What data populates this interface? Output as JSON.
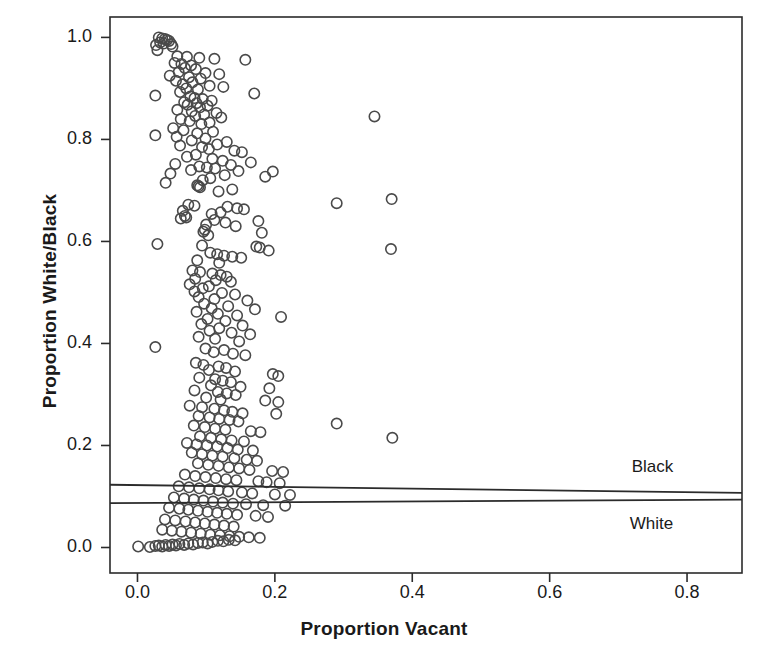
{
  "chart_data": {
    "type": "scatter",
    "title": "",
    "xlabel": "Proportion Vacant",
    "ylabel": "Proportion White/Black",
    "xlim": [
      -0.04,
      0.88
    ],
    "ylim": [
      -0.05,
      1.04
    ],
    "xticks": [
      "0.0",
      "0.2",
      "0.4",
      "0.6",
      "0.8"
    ],
    "xtick_values": [
      0.0,
      0.2,
      0.4,
      0.6,
      0.8
    ],
    "yticks": [
      "0.0",
      "0.2",
      "0.4",
      "0.6",
      "0.8",
      "1.0"
    ],
    "ytick_values": [
      0.0,
      0.2,
      0.4,
      0.6,
      0.8,
      1.0
    ],
    "grid": false,
    "marker": "open-circle",
    "marker_color": "#4a4a4a",
    "frame_color": "#2b2b2b",
    "legend_position": "inside-right",
    "annotations": [
      {
        "text": "Black",
        "x": 0.78,
        "y": 0.155
      },
      {
        "text": "White",
        "x": 0.78,
        "y": 0.045
      }
    ],
    "series": [
      {
        "name": "Black",
        "type": "fit-line",
        "x": [
          -0.04,
          0.88
        ],
        "y": [
          0.123,
          0.107
        ]
      },
      {
        "name": "White",
        "type": "fit-line",
        "x": [
          -0.04,
          0.88
        ],
        "y": [
          0.087,
          0.094
        ]
      }
    ],
    "points": [
      [
        0.031,
        1.0
      ],
      [
        0.036,
        0.998
      ],
      [
        0.04,
        0.997
      ],
      [
        0.043,
        0.995
      ],
      [
        0.046,
        0.993
      ],
      [
        0.033,
        0.99
      ],
      [
        0.038,
        0.988
      ],
      [
        0.049,
        0.987
      ],
      [
        0.027,
        0.985
      ],
      [
        0.051,
        0.982
      ],
      [
        0.029,
        0.975
      ],
      [
        0.058,
        0.963
      ],
      [
        0.072,
        0.962
      ],
      [
        0.09,
        0.96
      ],
      [
        0.112,
        0.958
      ],
      [
        0.157,
        0.956
      ],
      [
        0.054,
        0.95
      ],
      [
        0.064,
        0.948
      ],
      [
        0.078,
        0.945
      ],
      [
        0.069,
        0.94
      ],
      [
        0.085,
        0.938
      ],
      [
        0.06,
        0.932
      ],
      [
        0.099,
        0.93
      ],
      [
        0.119,
        0.928
      ],
      [
        0.047,
        0.925
      ],
      [
        0.075,
        0.922
      ],
      [
        0.092,
        0.919
      ],
      [
        0.056,
        0.915
      ],
      [
        0.08,
        0.912
      ],
      [
        0.066,
        0.908
      ],
      [
        0.105,
        0.905
      ],
      [
        0.125,
        0.903
      ],
      [
        0.071,
        0.9
      ],
      [
        0.088,
        0.898
      ],
      [
        0.062,
        0.893
      ],
      [
        0.17,
        0.89
      ],
      [
        0.026,
        0.886
      ],
      [
        0.077,
        0.884
      ],
      [
        0.083,
        0.881
      ],
      [
        0.095,
        0.879
      ],
      [
        0.108,
        0.876
      ],
      [
        0.068,
        0.873
      ],
      [
        0.086,
        0.871
      ],
      [
        0.073,
        0.868
      ],
      [
        0.102,
        0.866
      ],
      [
        0.091,
        0.863
      ],
      [
        0.058,
        0.858
      ],
      [
        0.079,
        0.855
      ],
      [
        0.115,
        0.852
      ],
      [
        0.097,
        0.849
      ],
      [
        0.084,
        0.846
      ],
      [
        0.122,
        0.843
      ],
      [
        0.063,
        0.84
      ],
      [
        0.076,
        0.836
      ],
      [
        0.105,
        0.833
      ],
      [
        0.093,
        0.83
      ],
      [
        0.052,
        0.822
      ],
      [
        0.067,
        0.818
      ],
      [
        0.11,
        0.815
      ],
      [
        0.087,
        0.812
      ],
      [
        0.026,
        0.808
      ],
      [
        0.057,
        0.805
      ],
      [
        0.099,
        0.802
      ],
      [
        0.079,
        0.798
      ],
      [
        0.13,
        0.795
      ],
      [
        0.116,
        0.79
      ],
      [
        0.062,
        0.788
      ],
      [
        0.094,
        0.785
      ],
      [
        0.104,
        0.781
      ],
      [
        0.141,
        0.778
      ],
      [
        0.152,
        0.775
      ],
      [
        0.085,
        0.77
      ],
      [
        0.072,
        0.766
      ],
      [
        0.109,
        0.762
      ],
      [
        0.124,
        0.758
      ],
      [
        0.165,
        0.755
      ],
      [
        0.055,
        0.752
      ],
      [
        0.136,
        0.75
      ],
      [
        0.09,
        0.747
      ],
      [
        0.101,
        0.745
      ],
      [
        0.113,
        0.743
      ],
      [
        0.078,
        0.74
      ],
      [
        0.147,
        0.738
      ],
      [
        0.197,
        0.737
      ],
      [
        0.048,
        0.733
      ],
      [
        0.127,
        0.73
      ],
      [
        0.186,
        0.727
      ],
      [
        0.106,
        0.724
      ],
      [
        0.095,
        0.72
      ],
      [
        0.041,
        0.715
      ],
      [
        0.087,
        0.71
      ],
      [
        0.089,
        0.708
      ],
      [
        0.091,
        0.706
      ],
      [
        0.138,
        0.702
      ],
      [
        0.118,
        0.698
      ],
      [
        0.345,
        0.845
      ],
      [
        0.29,
        0.675
      ],
      [
        0.37,
        0.683
      ],
      [
        0.074,
        0.672
      ],
      [
        0.083,
        0.67
      ],
      [
        0.131,
        0.668
      ],
      [
        0.145,
        0.665
      ],
      [
        0.155,
        0.663
      ],
      [
        0.066,
        0.66
      ],
      [
        0.121,
        0.657
      ],
      [
        0.108,
        0.654
      ],
      [
        0.069,
        0.65
      ],
      [
        0.071,
        0.647
      ],
      [
        0.063,
        0.645
      ],
      [
        0.112,
        0.642
      ],
      [
        0.176,
        0.64
      ],
      [
        0.128,
        0.637
      ],
      [
        0.1,
        0.633
      ],
      [
        0.143,
        0.63
      ],
      [
        0.098,
        0.623
      ],
      [
        0.096,
        0.619
      ],
      [
        0.181,
        0.617
      ],
      [
        0.103,
        0.612
      ],
      [
        0.029,
        0.595
      ],
      [
        0.094,
        0.592
      ],
      [
        0.173,
        0.59
      ],
      [
        0.178,
        0.588
      ],
      [
        0.369,
        0.585
      ],
      [
        0.191,
        0.582
      ],
      [
        0.106,
        0.578
      ],
      [
        0.116,
        0.575
      ],
      [
        0.126,
        0.572
      ],
      [
        0.138,
        0.57
      ],
      [
        0.151,
        0.568
      ],
      [
        0.087,
        0.563
      ],
      [
        0.119,
        0.558
      ],
      [
        0.08,
        0.543
      ],
      [
        0.091,
        0.54
      ],
      [
        0.109,
        0.537
      ],
      [
        0.121,
        0.534
      ],
      [
        0.13,
        0.531
      ],
      [
        0.084,
        0.527
      ],
      [
        0.114,
        0.524
      ],
      [
        0.136,
        0.521
      ],
      [
        0.076,
        0.516
      ],
      [
        0.104,
        0.512
      ],
      [
        0.095,
        0.508
      ],
      [
        0.083,
        0.502
      ],
      [
        0.123,
        0.499
      ],
      [
        0.142,
        0.496
      ],
      [
        0.089,
        0.491
      ],
      [
        0.112,
        0.487
      ],
      [
        0.16,
        0.484
      ],
      [
        0.097,
        0.478
      ],
      [
        0.132,
        0.473
      ],
      [
        0.108,
        0.469
      ],
      [
        0.171,
        0.467
      ],
      [
        0.086,
        0.462
      ],
      [
        0.117,
        0.458
      ],
      [
        0.145,
        0.455
      ],
      [
        0.209,
        0.452
      ],
      [
        0.102,
        0.448
      ],
      [
        0.128,
        0.444
      ],
      [
        0.093,
        0.438
      ],
      [
        0.153,
        0.435
      ],
      [
        0.119,
        0.43
      ],
      [
        0.105,
        0.425
      ],
      [
        0.137,
        0.421
      ],
      [
        0.164,
        0.418
      ],
      [
        0.089,
        0.413
      ],
      [
        0.113,
        0.409
      ],
      [
        0.148,
        0.404
      ],
      [
        0.026,
        0.393
      ],
      [
        0.099,
        0.39
      ],
      [
        0.126,
        0.387
      ],
      [
        0.111,
        0.383
      ],
      [
        0.139,
        0.38
      ],
      [
        0.157,
        0.377
      ],
      [
        0.085,
        0.362
      ],
      [
        0.096,
        0.358
      ],
      [
        0.118,
        0.355
      ],
      [
        0.129,
        0.352
      ],
      [
        0.104,
        0.348
      ],
      [
        0.142,
        0.345
      ],
      [
        0.197,
        0.34
      ],
      [
        0.205,
        0.336
      ],
      [
        0.09,
        0.333
      ],
      [
        0.113,
        0.33
      ],
      [
        0.124,
        0.327
      ],
      [
        0.136,
        0.324
      ],
      [
        0.107,
        0.318
      ],
      [
        0.15,
        0.315
      ],
      [
        0.192,
        0.312
      ],
      [
        0.083,
        0.308
      ],
      [
        0.117,
        0.305
      ],
      [
        0.13,
        0.302
      ],
      [
        0.143,
        0.299
      ],
      [
        0.1,
        0.294
      ],
      [
        0.121,
        0.29
      ],
      [
        0.186,
        0.288
      ],
      [
        0.205,
        0.285
      ],
      [
        0.076,
        0.278
      ],
      [
        0.094,
        0.275
      ],
      [
        0.112,
        0.272
      ],
      [
        0.126,
        0.269
      ],
      [
        0.138,
        0.266
      ],
      [
        0.153,
        0.263
      ],
      [
        0.202,
        0.262
      ],
      [
        0.089,
        0.258
      ],
      [
        0.105,
        0.255
      ],
      [
        0.119,
        0.252
      ],
      [
        0.134,
        0.25
      ],
      [
        0.147,
        0.247
      ],
      [
        0.29,
        0.243
      ],
      [
        0.082,
        0.239
      ],
      [
        0.098,
        0.236
      ],
      [
        0.113,
        0.233
      ],
      [
        0.128,
        0.231
      ],
      [
        0.165,
        0.228
      ],
      [
        0.179,
        0.226
      ],
      [
        0.371,
        0.215
      ],
      [
        0.091,
        0.218
      ],
      [
        0.107,
        0.215
      ],
      [
        0.122,
        0.212
      ],
      [
        0.137,
        0.21
      ],
      [
        0.155,
        0.208
      ],
      [
        0.072,
        0.205
      ],
      [
        0.086,
        0.202
      ],
      [
        0.101,
        0.2
      ],
      [
        0.116,
        0.198
      ],
      [
        0.131,
        0.195
      ],
      [
        0.146,
        0.192
      ],
      [
        0.168,
        0.19
      ],
      [
        0.079,
        0.186
      ],
      [
        0.094,
        0.183
      ],
      [
        0.109,
        0.18
      ],
      [
        0.124,
        0.178
      ],
      [
        0.141,
        0.175
      ],
      [
        0.159,
        0.172
      ],
      [
        0.174,
        0.17
      ],
      [
        0.088,
        0.165
      ],
      [
        0.103,
        0.162
      ],
      [
        0.118,
        0.16
      ],
      [
        0.133,
        0.157
      ],
      [
        0.148,
        0.155
      ],
      [
        0.163,
        0.152
      ],
      [
        0.196,
        0.15
      ],
      [
        0.212,
        0.148
      ],
      [
        0.069,
        0.143
      ],
      [
        0.084,
        0.14
      ],
      [
        0.099,
        0.138
      ],
      [
        0.114,
        0.136
      ],
      [
        0.129,
        0.134
      ],
      [
        0.144,
        0.132
      ],
      [
        0.176,
        0.13
      ],
      [
        0.188,
        0.128
      ],
      [
        0.207,
        0.126
      ],
      [
        0.06,
        0.12
      ],
      [
        0.075,
        0.118
      ],
      [
        0.09,
        0.116
      ],
      [
        0.105,
        0.114
      ],
      [
        0.118,
        0.112
      ],
      [
        0.132,
        0.11
      ],
      [
        0.152,
        0.108
      ],
      [
        0.167,
        0.106
      ],
      [
        0.2,
        0.104
      ],
      [
        0.222,
        0.103
      ],
      [
        0.053,
        0.098
      ],
      [
        0.068,
        0.096
      ],
      [
        0.082,
        0.094
      ],
      [
        0.096,
        0.092
      ],
      [
        0.11,
        0.09
      ],
      [
        0.124,
        0.088
      ],
      [
        0.139,
        0.086
      ],
      [
        0.158,
        0.085
      ],
      [
        0.183,
        0.083
      ],
      [
        0.215,
        0.082
      ],
      [
        0.046,
        0.078
      ],
      [
        0.061,
        0.076
      ],
      [
        0.074,
        0.074
      ],
      [
        0.088,
        0.072
      ],
      [
        0.102,
        0.07
      ],
      [
        0.116,
        0.068
      ],
      [
        0.13,
        0.066
      ],
      [
        0.145,
        0.064
      ],
      [
        0.172,
        0.062
      ],
      [
        0.19,
        0.06
      ],
      [
        0.04,
        0.055
      ],
      [
        0.055,
        0.053
      ],
      [
        0.07,
        0.051
      ],
      [
        0.084,
        0.049
      ],
      [
        0.098,
        0.047
      ],
      [
        0.112,
        0.045
      ],
      [
        0.126,
        0.043
      ],
      [
        0.14,
        0.041
      ],
      [
        0.036,
        0.035
      ],
      [
        0.05,
        0.033
      ],
      [
        0.064,
        0.031
      ],
      [
        0.078,
        0.029
      ],
      [
        0.092,
        0.027
      ],
      [
        0.106,
        0.025
      ],
      [
        0.12,
        0.024
      ],
      [
        0.134,
        0.022
      ],
      [
        0.148,
        0.021
      ],
      [
        0.162,
        0.02
      ],
      [
        0.178,
        0.019
      ],
      [
        0.001,
        0.002
      ],
      [
        0.018,
        0.001
      ],
      [
        0.026,
        0.003
      ],
      [
        0.031,
        0.004
      ],
      [
        0.036,
        0.002
      ],
      [
        0.041,
        0.005
      ],
      [
        0.046,
        0.003
      ],
      [
        0.051,
        0.006
      ],
      [
        0.056,
        0.004
      ],
      [
        0.061,
        0.007
      ],
      [
        0.068,
        0.005
      ],
      [
        0.074,
        0.008
      ],
      [
        0.081,
        0.006
      ],
      [
        0.088,
        0.009
      ],
      [
        0.095,
        0.01
      ],
      [
        0.102,
        0.008
      ],
      [
        0.109,
        0.011
      ],
      [
        0.117,
        0.013
      ],
      [
        0.125,
        0.012
      ],
      [
        0.133,
        0.015
      ],
      [
        0.142,
        0.014
      ]
    ]
  }
}
